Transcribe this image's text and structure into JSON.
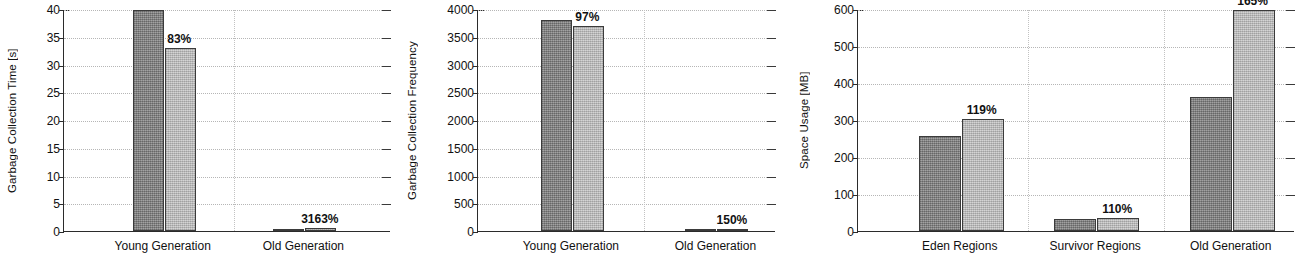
{
  "figure": {
    "background": "#ffffff",
    "bar_colors": {
      "baseline": "#8d8d8d",
      "comparison": "#c4c4c4"
    },
    "axis_color": "#2b2b2b",
    "grid_color": "#b6b6b6"
  },
  "chart_data": [
    {
      "type": "bar",
      "title": "",
      "xlabel": "",
      "ylabel": "Garbage Collection Time [s]",
      "categories": [
        "Young Generation",
        "Old Generation"
      ],
      "series": [
        {
          "name": "baseline",
          "values": [
            39.8,
            0.02
          ]
        },
        {
          "name": "comparison",
          "values": [
            33.0,
            0.6
          ]
        }
      ],
      "annotations": [
        "83%",
        "3163%"
      ],
      "ylim": [
        0,
        40
      ],
      "yticks": [
        0,
        5,
        10,
        15,
        20,
        25,
        30,
        35,
        40
      ],
      "ytick_labels": [
        "0",
        "5",
        "10",
        "15",
        "20",
        "25",
        "30",
        "35",
        "40"
      ],
      "grid": true,
      "legend": "none"
    },
    {
      "type": "bar",
      "title": "",
      "xlabel": "",
      "ylabel": "Garbage Collection Frequency",
      "categories": [
        "Young Generation",
        "Old Generation"
      ],
      "series": [
        {
          "name": "baseline",
          "values": [
            3810,
            8
          ]
        },
        {
          "name": "comparison",
          "values": [
            3690,
            12
          ]
        }
      ],
      "annotations": [
        "97%",
        "150%"
      ],
      "ylim": [
        0,
        4000
      ],
      "yticks": [
        0,
        500,
        1000,
        1500,
        2000,
        2500,
        3000,
        3500,
        4000
      ],
      "ytick_labels": [
        "0",
        "500",
        "1000",
        "1500",
        "2000",
        "2500",
        "3000",
        "3500",
        "4000"
      ],
      "grid": true,
      "legend": "none"
    },
    {
      "type": "bar",
      "title": "",
      "xlabel": "",
      "ylabel": "Space Usage [MB]",
      "categories": [
        "Eden Regions",
        "Survivor Regions",
        "Old Generation"
      ],
      "series": [
        {
          "name": "baseline",
          "values": [
            256,
            32,
            361
          ]
        },
        {
          "name": "comparison",
          "values": [
            304,
            35,
            597
          ]
        }
      ],
      "annotations": [
        "119%",
        "110%",
        "165%"
      ],
      "ylim": [
        0,
        600
      ],
      "yticks": [
        0,
        100,
        200,
        300,
        400,
        500,
        600
      ],
      "ytick_labels": [
        "0",
        "100",
        "200",
        "300",
        "400",
        "500",
        "600"
      ],
      "grid": true,
      "legend": "none"
    }
  ]
}
